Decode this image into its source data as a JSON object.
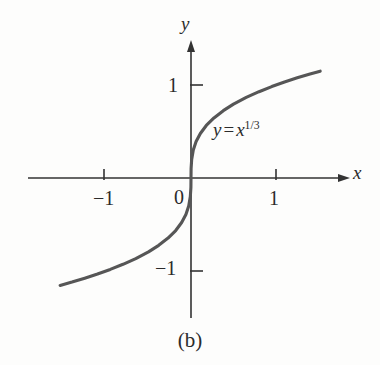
{
  "figure": {
    "caption": "(b)",
    "background_color": "#fdfdfc",
    "axis_color": "#333333",
    "curve_color": "#565656",
    "text_color": "#2b2b2b"
  },
  "axes": {
    "y_axis_name": "y",
    "x_axis_name": "x",
    "origin_label": "0"
  },
  "equation": {
    "lhs": "y",
    "operator": "=",
    "base": "x",
    "exponent": "1/3",
    "full_text": "y = x^(1/3)"
  },
  "ticks": {
    "x_positive": "1",
    "x_negative": "−1",
    "y_positive": "1",
    "y_negative": "−1"
  },
  "chart_data": {
    "type": "line",
    "title": "(b)",
    "annotations": [
      "y = x^(1/3)"
    ],
    "xlabel": "x",
    "ylabel": "y",
    "xlim": [
      -1.95,
      1.88
    ],
    "ylim": [
      -1.47,
      1.47
    ],
    "xticks": [
      -1,
      1
    ],
    "xticklabels": [
      "−1",
      "1"
    ],
    "yticks": [
      -1,
      1
    ],
    "yticklabels": [
      "−1",
      "1"
    ],
    "grid": false,
    "legend": "none",
    "series": [
      {
        "name": "y = x^(1/3)",
        "color": "#565656",
        "x": [
          -1.54,
          -1.4,
          -1.25,
          -1.1,
          -0.95,
          -0.8,
          -0.65,
          -0.5,
          -0.38,
          -0.27,
          -0.18,
          -0.11,
          -0.06,
          -0.027,
          -0.008,
          -0.001,
          0.0,
          0.001,
          0.008,
          0.027,
          0.06,
          0.11,
          0.18,
          0.27,
          0.38,
          0.5,
          0.65,
          0.8,
          0.95,
          1.1,
          1.25,
          1.4,
          1.52
        ],
        "y": [
          -1.155,
          -1.119,
          -1.077,
          -1.032,
          -0.983,
          -0.928,
          -0.866,
          -0.794,
          -0.724,
          -0.646,
          -0.565,
          -0.479,
          -0.392,
          -0.3,
          -0.2,
          -0.1,
          0.0,
          0.1,
          0.2,
          0.3,
          0.392,
          0.479,
          0.565,
          0.646,
          0.724,
          0.794,
          0.866,
          0.928,
          0.983,
          1.032,
          1.077,
          1.119,
          1.149
        ]
      }
    ]
  }
}
